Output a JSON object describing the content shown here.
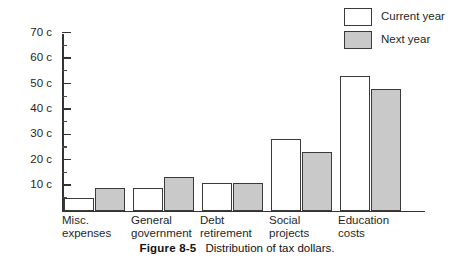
{
  "caption": {
    "figure_number": "Figure 8-5",
    "text": "Distribution of tax dollars."
  },
  "legend": {
    "position": "top-right",
    "entries": [
      {
        "label": "Current year",
        "swatch": "white-square-icon",
        "color": "#ffffff"
      },
      {
        "label": "Next year",
        "swatch": "gray-square-icon",
        "color": "#c9c9c9"
      }
    ]
  },
  "axis": {
    "y_tick_labels": [
      "70 c",
      "60 c",
      "50 c",
      "40 c",
      "30 c",
      "20 c",
      "10 c"
    ],
    "y_unit": "c"
  },
  "chart_data": {
    "type": "bar",
    "title": "Distribution of tax dollars.",
    "xlabel": "",
    "ylabel": "",
    "ylim": [
      0,
      70
    ],
    "ytick_values": [
      10,
      20,
      30,
      40,
      50,
      60,
      70
    ],
    "yticklabels": [
      "10 c",
      "20 c",
      "30 c",
      "40 c",
      "50 c",
      "60 c",
      "70 c"
    ],
    "y_minor_tick_step": 5,
    "grid": false,
    "legend_position": "top-right",
    "categories": [
      "Misc. expenses",
      "General government",
      "Debt retirement",
      "Social projects",
      "Education costs"
    ],
    "category_lines": [
      [
        "Misc.",
        "expenses"
      ],
      [
        "General",
        "government"
      ],
      [
        "Debt",
        "retirement"
      ],
      [
        "Social",
        "projects"
      ],
      [
        "Education",
        "costs"
      ]
    ],
    "series": [
      {
        "name": "Current year",
        "color": "#ffffff",
        "values": [
          5,
          9,
          11,
          28,
          53
        ]
      },
      {
        "name": "Next year",
        "color": "#c9c9c9",
        "values": [
          9,
          13,
          11,
          23,
          48
        ]
      }
    ]
  }
}
